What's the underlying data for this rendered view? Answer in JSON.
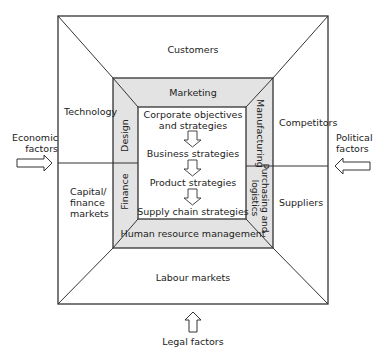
{
  "diagram": {
    "external_factors": {
      "left": "Economic factors",
      "left_line1": "Economic",
      "left_line2": "factors",
      "right_line1": "Political",
      "right_line2": "factors",
      "bottom": "Legal factors"
    },
    "outer_ring": {
      "top": "Customers",
      "left_upper": "Technology",
      "left_lower_line1": "Capital/",
      "left_lower_line2": "finance",
      "left_lower_line3": "markets",
      "right_upper": "Competitors",
      "right_lower": "Suppliers",
      "bottom": "Labour markets"
    },
    "functional_ring": {
      "top": "Marketing",
      "left_upper": "Design",
      "left_lower": "Finance",
      "right_upper": "Manufacturing",
      "right_lower_line1": "Purchasing and",
      "right_lower_line2": "logistics",
      "bottom": "Human resource management"
    },
    "strategy_core": {
      "items": [
        {
          "line1": "Corporate objectives",
          "line2": "and strategies"
        },
        {
          "line1": "Business strategies"
        },
        {
          "line1": "Product strategies"
        },
        {
          "line1": "Supply chain strategies"
        }
      ]
    },
    "colors": {
      "line": "#333333",
      "functional_fill": "#e3e3e3",
      "background": "#ffffff"
    }
  }
}
